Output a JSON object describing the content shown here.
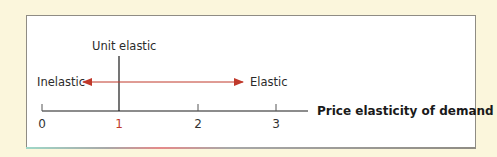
{
  "diagram": {
    "axis_title": "Price elasticity of demand",
    "ticks": [
      {
        "label": "0",
        "value": 0,
        "color": "#333333"
      },
      {
        "label": "1",
        "value": 1,
        "color": "#c0392b"
      },
      {
        "label": "2",
        "value": 2,
        "color": "#333333"
      },
      {
        "label": "3",
        "value": 3,
        "color": "#333333"
      }
    ],
    "unit_label": "Unit elastic",
    "left_label": "Inelastic",
    "right_label": "Elastic",
    "colors": {
      "background": "#fbf6dc",
      "panel": "#ffffff",
      "arrow": "#c0392b",
      "axis": "#1a1a1a"
    }
  }
}
